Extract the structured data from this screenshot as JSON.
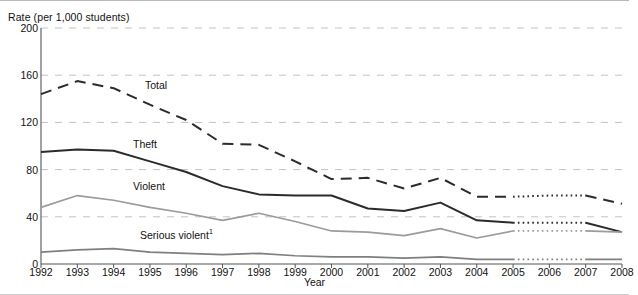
{
  "chart_data": {
    "type": "line",
    "title": "",
    "ylabel": "Rate (per 1,000 students)",
    "xlabel": "Year",
    "ylim": [
      0,
      200
    ],
    "yticks": [
      0,
      40,
      80,
      120,
      160,
      200
    ],
    "grid": true,
    "legend": "inline-labels",
    "categories": [
      1992,
      1993,
      1994,
      1995,
      1996,
      1997,
      1998,
      1999,
      2000,
      2001,
      2002,
      2003,
      2004,
      2005,
      2006,
      2007,
      2008
    ],
    "x": [
      "1992",
      "1993",
      "1994",
      "1995",
      "1996",
      "1997",
      "1998",
      "1999",
      "2000",
      "2001",
      "2002",
      "2003",
      "2004",
      "2005",
      "2006",
      "2007",
      "2008"
    ],
    "series": [
      {
        "name": "Total",
        "label": "Total",
        "style": "dashed",
        "color": "#2b2b2b",
        "values": [
          144,
          155,
          149,
          135,
          122,
          102,
          101,
          87,
          72,
          73,
          64,
          73,
          57,
          57,
          58,
          58,
          51
        ],
        "projected_from": 2005,
        "projected_to": 2007
      },
      {
        "name": "Theft",
        "label": "Theft",
        "style": "solid",
        "color": "#2b2b2b",
        "values": [
          95,
          97,
          96,
          87,
          78,
          66,
          59,
          58,
          58,
          47,
          45,
          52,
          37,
          35,
          35,
          35,
          27
        ],
        "projected_from": 2005,
        "projected_to": 2007
      },
      {
        "name": "Violent",
        "label": "Violent",
        "style": "solid",
        "color": "#9b9b9b",
        "values": [
          48,
          58,
          54,
          48,
          43,
          37,
          43,
          36,
          28,
          27,
          24,
          30,
          22,
          28,
          28,
          28,
          27
        ],
        "projected_from": 2005,
        "projected_to": 2007
      },
      {
        "name": "Serious violent",
        "label": "Serious violent",
        "label_superscript": "1",
        "style": "solid",
        "color": "#7f7f7f",
        "values": [
          10,
          12,
          13,
          10,
          9,
          8,
          9,
          7,
          6,
          6,
          5,
          6,
          4,
          4,
          4,
          4,
          4
        ],
        "projected_from": 2005,
        "projected_to": 2007
      }
    ]
  },
  "axes": {
    "y_title": "Rate (per 1,000 students)",
    "x_title": "Year",
    "y_tick_labels": [
      "200",
      "160",
      "120",
      "80",
      "40",
      "0"
    ],
    "x_tick_labels": [
      "1992",
      "1993",
      "1994",
      "1995",
      "1996",
      "1997",
      "1998",
      "1999",
      "2000",
      "2001",
      "2002",
      "2003",
      "2004",
      "2005",
      "2006",
      "2007",
      "2008"
    ]
  },
  "series_labels": {
    "total": "Total",
    "theft": "Theft",
    "violent": "Violent",
    "serious_violent": "Serious violent",
    "serious_violent_superscript": "1"
  },
  "colors": {
    "dark_line": "#2b2b2b",
    "mid_gray_line": "#7f7f7f",
    "light_gray_line": "#9b9b9b",
    "gridline": "#b8c4cf",
    "axis": "#555555"
  }
}
